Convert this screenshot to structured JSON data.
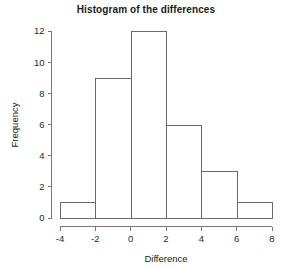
{
  "chart_data": {
    "type": "bar",
    "title": "Histogram of the differences",
    "xlabel": "Difference",
    "ylabel": "Frequency",
    "categories": [
      "-4 to -2",
      "-2 to 0",
      "0 to 2",
      "2 to 4",
      "4 to 6",
      "6 to 8"
    ],
    "bin_edges": [
      -4,
      -2,
      0,
      2,
      4,
      6,
      8
    ],
    "values": [
      1,
      9,
      12,
      6,
      3,
      1
    ],
    "bin_width": 2,
    "xlim": [
      -4,
      8
    ],
    "ylim": [
      0,
      12
    ],
    "xticks": [
      -4,
      -2,
      0,
      2,
      4,
      6,
      8
    ],
    "xtick_labels": [
      "-4",
      "-2",
      "0",
      "2",
      "4",
      "6",
      "8"
    ],
    "yticks": [
      0,
      2,
      4,
      6,
      8,
      10,
      12
    ],
    "ytick_labels": [
      "0",
      "2",
      "4",
      "6",
      "8",
      "10",
      "12"
    ],
    "grid": false,
    "legend": false,
    "bar_fill_color": "#ffffff",
    "bar_stroke_color": "#6a6a6a",
    "axis_color": "#777777",
    "background_color": "#ffffff",
    "text_color": "#1a1a1a"
  }
}
